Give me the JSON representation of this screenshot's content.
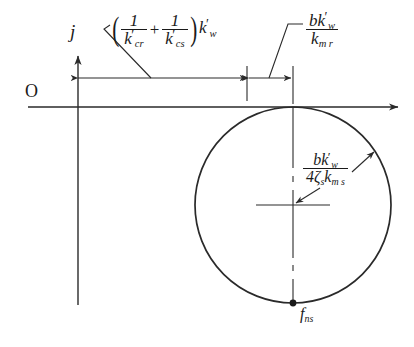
{
  "figure": {
    "axes": {
      "imaginary_label": "j",
      "origin_label": "O",
      "real_axis_direction": "right",
      "imaginary_axis_direction": "up"
    },
    "labels": {
      "expr_left": {
        "text": "(1/k'_cr + 1/k'_cs) k'_w",
        "num1": "1",
        "den1_base": "k",
        "den1_sub": "cr",
        "num2": "1",
        "den2_base": "k",
        "den2_sub": "cs",
        "operator": "+",
        "multiplier_base": "k",
        "multiplier_sub": "w",
        "paren_open": "(",
        "paren_close": ")"
      },
      "expr_right": {
        "text": "b k'_w / k_mr",
        "num_prefix": "b",
        "num_base": "k",
        "num_sub": "w",
        "den_base": "k",
        "den_sub": "m r"
      },
      "radius": {
        "text": "b k'_w / (4 zeta_s k_ms)",
        "num_prefix": "b",
        "num_base": "k",
        "num_sub": "w",
        "den_prefix": "4",
        "den_zeta": "ζ",
        "den_zeta_sub": "s",
        "den_base": "k",
        "den_sub": "m s"
      },
      "point_bottom": {
        "base": "f",
        "sub": "ns"
      }
    },
    "geometry": {
      "circle_center_x": 293,
      "circle_center_y": 205,
      "circle_radius": 98,
      "horizontal_axis_y": 107,
      "vertical_axis_x": 78,
      "dimension_line_y": 78,
      "tick1_x": 247,
      "tick2_x": 293
    },
    "colors": {
      "stroke": "#2a2a2a",
      "text": "#1a1a1a",
      "background": "#ffffff"
    }
  }
}
